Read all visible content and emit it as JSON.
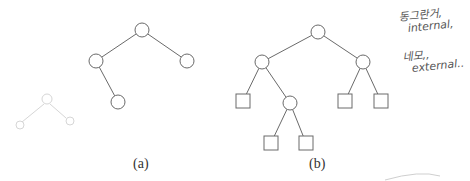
{
  "figure": {
    "captions": {
      "a": "(a)",
      "b": "(b)"
    },
    "tree_a": {
      "nodes": [
        {
          "id": "r",
          "type": "internal",
          "x": 142,
          "y": 30
        },
        {
          "id": "l",
          "type": "internal",
          "x": 96,
          "y": 61
        },
        {
          "id": "rr",
          "type": "internal",
          "x": 187,
          "y": 61
        },
        {
          "id": "lr",
          "type": "internal",
          "x": 118,
          "y": 102
        }
      ],
      "edges": [
        [
          "r",
          "l"
        ],
        [
          "r",
          "rr"
        ],
        [
          "l",
          "lr"
        ]
      ]
    },
    "tree_b": {
      "nodes": [
        {
          "id": "r",
          "type": "internal",
          "x": 318,
          "y": 32
        },
        {
          "id": "l",
          "type": "internal",
          "x": 262,
          "y": 62
        },
        {
          "id": "rr",
          "type": "internal",
          "x": 363,
          "y": 62
        },
        {
          "id": "ll",
          "type": "external",
          "x": 243,
          "y": 101
        },
        {
          "id": "lr",
          "type": "internal",
          "x": 290,
          "y": 103
        },
        {
          "id": "lrl",
          "type": "external",
          "x": 271,
          "y": 143
        },
        {
          "id": "lrr",
          "type": "external",
          "x": 306,
          "y": 143
        },
        {
          "id": "rrl",
          "type": "external",
          "x": 345,
          "y": 101
        },
        {
          "id": "rrr",
          "type": "external",
          "x": 381,
          "y": 101
        }
      ],
      "edges": [
        [
          "r",
          "l"
        ],
        [
          "r",
          "rr"
        ],
        [
          "l",
          "ll"
        ],
        [
          "l",
          "lr"
        ],
        [
          "lr",
          "lrl"
        ],
        [
          "lr",
          "lrr"
        ],
        [
          "rr",
          "rrl"
        ],
        [
          "rr",
          "rrr"
        ]
      ]
    }
  },
  "annotations": {
    "line1": "동그란거,",
    "line2": "internal,",
    "line3": "네모,,",
    "line4": "external.."
  },
  "colors": {
    "stroke": "#6a6a6a",
    "ink": "#444444",
    "faint": "#d8d8d8"
  }
}
